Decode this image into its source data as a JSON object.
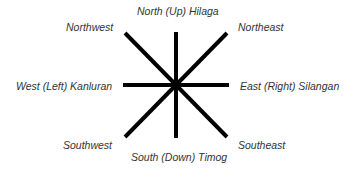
{
  "diagram": {
    "type": "compass-rose",
    "line_color": "#000000",
    "text_color": "#333333",
    "center": [
      176,
      85
    ],
    "labels": {
      "north": "North (Up) Hilaga",
      "northeast": "Northeast",
      "east": "East (Right) Silangan",
      "southeast": "Southeast",
      "south": "South (Down) Timog",
      "southwest": "Southwest",
      "west": "West (Left) Kanluran",
      "northwest": "Northwest"
    }
  }
}
